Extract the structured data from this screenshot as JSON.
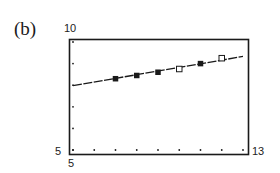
{
  "panel": {
    "label": "(b)"
  },
  "axes": {
    "y_max_label": "10",
    "y_min_label": "5",
    "x_min_label": "5",
    "x_max_label": "13"
  },
  "colors": {
    "ink": "#1a1a1a",
    "background": "#ffffff"
  },
  "chart_data": {
    "type": "scatter",
    "title": "",
    "panel_label": "(b)",
    "xlabel": "",
    "ylabel": "",
    "xlim": [
      5,
      13
    ],
    "ylim": [
      5,
      10
    ],
    "x_tick_labels": [
      "5",
      "13"
    ],
    "y_tick_labels": [
      "5",
      "10"
    ],
    "x_tick_marks": [
      5,
      6,
      7,
      8,
      9,
      10,
      11,
      12,
      13
    ],
    "y_tick_marks": [
      5,
      6,
      7,
      8,
      9,
      10
    ],
    "grid": false,
    "legend": null,
    "series": [
      {
        "name": "data points (filled squares)",
        "marker": "filled-square",
        "x": [
          7,
          8,
          9,
          11
        ],
        "y": [
          8.3,
          8.45,
          8.6,
          9.0
        ]
      },
      {
        "name": "data points (open squares)",
        "marker": "open-square",
        "x": [
          10,
          12
        ],
        "y": [
          8.75,
          9.25
        ]
      },
      {
        "name": "regression line",
        "type": "line",
        "x": [
          5,
          13
        ],
        "y": [
          7.98,
          9.33
        ]
      }
    ]
  }
}
